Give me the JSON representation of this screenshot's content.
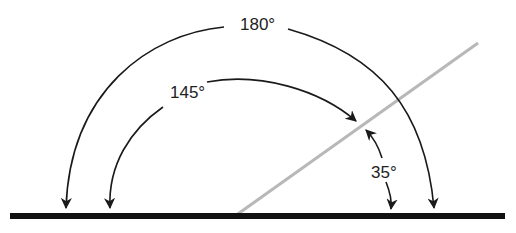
{
  "diagram": {
    "type": "angle-diagram",
    "labels": {
      "angle_180": "180°",
      "angle_145": "145°",
      "angle_35": "35°"
    },
    "angles": [
      {
        "name": "straight-angle",
        "value_deg": 180
      },
      {
        "name": "obtuse-angle",
        "value_deg": 145
      },
      {
        "name": "acute-angle",
        "value_deg": 35
      }
    ],
    "colors": {
      "baseline": "#111111",
      "ray": "#b8b8b8",
      "arc": "#1a1a1a",
      "text": "#222222"
    }
  }
}
